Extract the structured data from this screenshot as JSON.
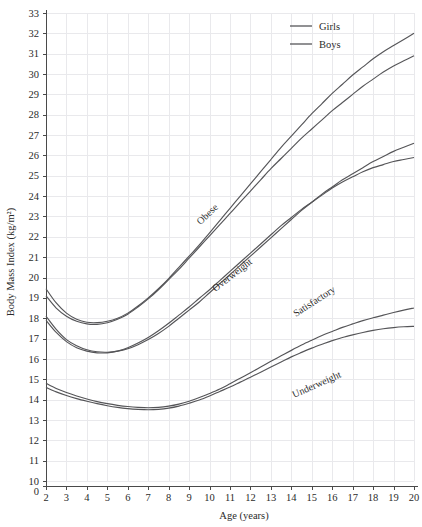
{
  "chart_data": {
    "type": "line",
    "title": "",
    "xlabel": "Age (years)",
    "ylabel": "Body Mass Index (kg/m²)",
    "xlim": [
      2,
      20
    ],
    "ylim": [
      10,
      33
    ],
    "y_axis_break": true,
    "y_baseline_label": "0",
    "grid": true,
    "legend_position": "top-right",
    "xticks": [
      2,
      3,
      4,
      5,
      6,
      7,
      8,
      9,
      10,
      11,
      12,
      13,
      14,
      15,
      16,
      17,
      18,
      19,
      20
    ],
    "xtick_labels": [
      "2",
      "3",
      "4",
      "5",
      "6",
      "7",
      "8",
      "9",
      "10",
      "11",
      "12",
      "13",
      "14",
      "15",
      "16",
      "17",
      "18",
      "19",
      "20"
    ],
    "yticks": [
      10,
      11,
      12,
      13,
      14,
      15,
      16,
      17,
      18,
      19,
      20,
      21,
      22,
      23,
      24,
      25,
      26,
      27,
      28,
      29,
      30,
      31,
      32,
      33
    ],
    "ytick_labels": [
      "10",
      "11",
      "12",
      "13",
      "14",
      "15",
      "16",
      "17",
      "18",
      "19",
      "20",
      "21",
      "22",
      "23",
      "24",
      "25",
      "26",
      "27",
      "28",
      "29",
      "30",
      "31",
      "32",
      "33"
    ],
    "legend": [
      {
        "name": "Girls",
        "color": "#555558"
      },
      {
        "name": "Boys",
        "color": "#555558"
      }
    ],
    "annotations": [
      {
        "text": "Obese",
        "x": 10.0,
        "y": 23.0,
        "rotation": -44
      },
      {
        "text": "Overweight",
        "x": 11.2,
        "y": 20.0,
        "rotation": -38
      },
      {
        "text": "Satisfactory",
        "x": 15.2,
        "y": 18.7,
        "rotation": -33
      },
      {
        "text": "Underweight",
        "x": 15.3,
        "y": 14.6,
        "rotation": -24
      }
    ],
    "x": [
      2,
      2.5,
      3,
      3.5,
      4,
      4.5,
      5,
      5.5,
      6,
      6.5,
      7,
      7.5,
      8,
      8.5,
      9,
      9.5,
      10,
      10.5,
      11,
      11.5,
      12,
      12.5,
      13,
      13.5,
      14,
      14.5,
      15,
      15.5,
      16,
      16.5,
      17,
      17.5,
      18,
      18.5,
      19,
      19.5,
      20
    ],
    "series": [
      {
        "name": "Obese - Girls",
        "band": "Obese",
        "sex": "Girls",
        "values": [
          19.45,
          18.75,
          18.25,
          17.95,
          17.8,
          17.78,
          17.85,
          18.0,
          18.25,
          18.6,
          19.0,
          19.45,
          19.95,
          20.5,
          21.05,
          21.6,
          22.2,
          22.8,
          23.4,
          24.0,
          24.6,
          25.2,
          25.8,
          26.4,
          26.95,
          27.5,
          28.05,
          28.55,
          29.05,
          29.5,
          29.95,
          30.35,
          30.75,
          31.1,
          31.4,
          31.7,
          32.0
        ]
      },
      {
        "name": "Obese - Boys",
        "band": "Obese",
        "sex": "Boys",
        "values": [
          19.1,
          18.5,
          18.1,
          17.85,
          17.72,
          17.7,
          17.78,
          17.95,
          18.2,
          18.55,
          18.95,
          19.4,
          19.9,
          20.4,
          20.95,
          21.5,
          22.05,
          22.6,
          23.15,
          23.7,
          24.25,
          24.8,
          25.35,
          25.85,
          26.35,
          26.85,
          27.3,
          27.75,
          28.2,
          28.6,
          29.0,
          29.4,
          29.75,
          30.1,
          30.4,
          30.65,
          30.9
        ]
      },
      {
        "name": "Overweight - Girls",
        "band": "Overweight",
        "sex": "Girls",
        "values": [
          18.1,
          17.45,
          16.95,
          16.65,
          16.45,
          16.35,
          16.33,
          16.38,
          16.5,
          16.7,
          16.95,
          17.25,
          17.6,
          18.0,
          18.4,
          18.8,
          19.25,
          19.7,
          20.15,
          20.6,
          21.05,
          21.5,
          21.95,
          22.4,
          22.85,
          23.3,
          23.7,
          24.1,
          24.45,
          24.8,
          25.1,
          25.4,
          25.7,
          25.95,
          26.2,
          26.4,
          26.6
        ]
      },
      {
        "name": "Overweight - Boys",
        "band": "Overweight",
        "sex": "Boys",
        "values": [
          17.9,
          17.3,
          16.85,
          16.55,
          16.38,
          16.3,
          16.3,
          16.38,
          16.55,
          16.78,
          17.05,
          17.38,
          17.75,
          18.15,
          18.55,
          18.98,
          19.4,
          19.85,
          20.3,
          20.75,
          21.2,
          21.65,
          22.1,
          22.55,
          22.95,
          23.35,
          23.7,
          24.05,
          24.4,
          24.7,
          24.95,
          25.2,
          25.4,
          25.55,
          25.7,
          25.8,
          25.9
        ]
      },
      {
        "name": "Underweight - Girls",
        "band": "Underweight",
        "sex": "Girls",
        "values": [
          14.8,
          14.55,
          14.35,
          14.18,
          14.03,
          13.9,
          13.8,
          13.72,
          13.66,
          13.62,
          13.6,
          13.62,
          13.68,
          13.78,
          13.92,
          14.1,
          14.3,
          14.52,
          14.78,
          15.05,
          15.32,
          15.6,
          15.88,
          16.15,
          16.42,
          16.68,
          16.92,
          17.15,
          17.35,
          17.55,
          17.72,
          17.88,
          18.02,
          18.15,
          18.28,
          18.4,
          18.5
        ]
      },
      {
        "name": "Underweight - Boys",
        "band": "Underweight",
        "sex": "Boys",
        "values": [
          14.6,
          14.38,
          14.2,
          14.05,
          13.92,
          13.8,
          13.7,
          13.62,
          13.56,
          13.52,
          13.5,
          13.52,
          13.58,
          13.68,
          13.82,
          13.98,
          14.18,
          14.4,
          14.62,
          14.86,
          15.1,
          15.35,
          15.6,
          15.85,
          16.1,
          16.32,
          16.53,
          16.72,
          16.9,
          17.05,
          17.18,
          17.3,
          17.4,
          17.48,
          17.54,
          17.58,
          17.6
        ]
      }
    ]
  }
}
